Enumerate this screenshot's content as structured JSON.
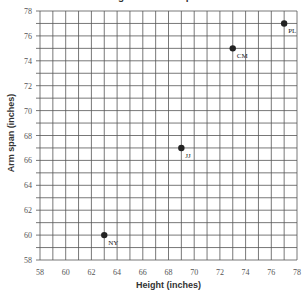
{
  "chart_data": {
    "type": "scatter",
    "title": "Height and Arm Span",
    "xlabel": "Height (inches)",
    "ylabel": "Arm span (inches)",
    "xlim": [
      58,
      78
    ],
    "ylim": [
      58,
      78
    ],
    "x_ticks": [
      58,
      60,
      62,
      64,
      66,
      68,
      70,
      72,
      74,
      76,
      78
    ],
    "y_ticks": [
      58,
      60,
      62,
      64,
      66,
      68,
      70,
      72,
      74,
      76,
      78
    ],
    "grid": true,
    "grid_step": 1,
    "legend": null,
    "points": [
      {
        "label": "NY",
        "x": 63,
        "y": 60
      },
      {
        "label": "JJ",
        "x": 69,
        "y": 67
      },
      {
        "label": "CM",
        "x": 73,
        "y": 75
      },
      {
        "label": "PL",
        "x": 77,
        "y": 77
      }
    ]
  },
  "colors": {
    "grid": "#555555",
    "point": "#222222",
    "text": "#555555"
  }
}
